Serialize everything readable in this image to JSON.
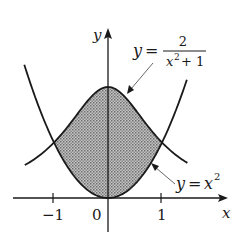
{
  "figure": {
    "axes": {
      "x_label": "x",
      "y_label": "y"
    },
    "ticks": {
      "neg_one": "−1",
      "zero": "0",
      "one": "1"
    },
    "curves": {
      "bell": {
        "lhs": "y",
        "eq": "=",
        "numerator": "2",
        "denominator_base": "x",
        "denominator_exp": "2",
        "denominator_rest": "+ 1"
      },
      "parabola": {
        "lhs": "y",
        "eq": "=",
        "base": "x",
        "exp": "2"
      }
    },
    "shading": {
      "from_x": -1,
      "to_x": 1,
      "fill": "#9a9a9a"
    },
    "colors": {
      "ink": "#1a1a1a",
      "shade": "#a8a8a8",
      "background": "#ffffff"
    }
  }
}
